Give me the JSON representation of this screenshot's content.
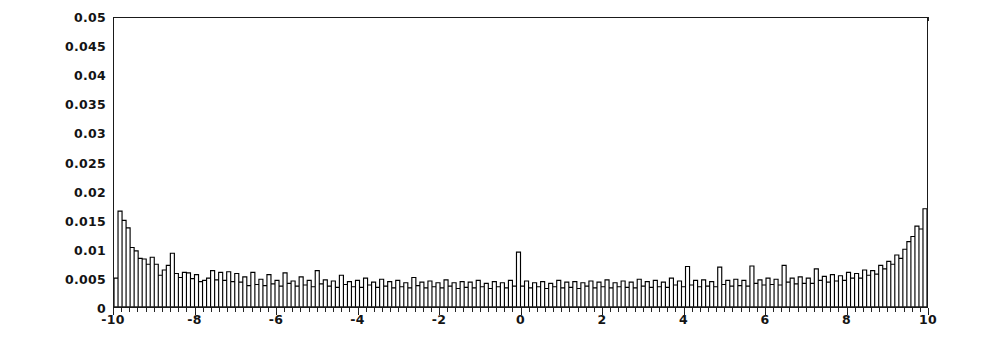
{
  "chart_data": {
    "type": "bar",
    "title": "",
    "subtitle": "",
    "xlabel": "",
    "ylabel": "",
    "xlim": [
      -10,
      10
    ],
    "ylim": [
      0,
      0.05
    ],
    "grid": false,
    "legend": null,
    "bar_color": "#ffffff",
    "bar_edge_color": "#000000",
    "axis_color": "#1a1a1a",
    "background_color": "#ffffff",
    "n_bins": 200,
    "bin_width": 0.1,
    "x_ticks": [
      -10,
      -8,
      -6,
      -4,
      -2,
      0,
      2,
      4,
      6,
      8,
      10
    ],
    "x_tick_labels": [
      "-10",
      "-8",
      "-6",
      "-4",
      "-2",
      "0",
      "2",
      "4",
      "6",
      "8",
      "10"
    ],
    "y_ticks": [
      0,
      0.005,
      0.01,
      0.015,
      0.02,
      0.025,
      0.03,
      0.035,
      0.04,
      0.045,
      0.05
    ],
    "y_tick_labels": [
      "0",
      "0.005",
      "0.01",
      "0.015",
      "0.02",
      "0.025",
      "0.03",
      "0.035",
      "0.04",
      "0.045",
      "0.05"
    ],
    "bin_centers": [
      -9.95,
      -9.85,
      -9.75,
      -9.65,
      -9.55,
      -9.45,
      -9.35,
      -9.25,
      -9.15,
      -9.05,
      -8.95,
      -8.85,
      -8.75,
      -8.65,
      -8.55,
      -8.45,
      -8.35,
      -8.25,
      -8.15,
      -8.05,
      -7.95,
      -7.85,
      -7.75,
      -7.65,
      -7.55,
      -7.45,
      -7.35,
      -7.25,
      -7.15,
      -7.05,
      -6.95,
      -6.85,
      -6.75,
      -6.65,
      -6.55,
      -6.45,
      -6.35,
      -6.25,
      -6.15,
      -6.05,
      -5.95,
      -5.85,
      -5.75,
      -5.65,
      -5.55,
      -5.45,
      -5.35,
      -5.25,
      -5.15,
      -5.05,
      -4.95,
      -4.85,
      -4.75,
      -4.65,
      -4.55,
      -4.45,
      -4.35,
      -4.25,
      -4.15,
      -4.05,
      -3.95,
      -3.85,
      -3.75,
      -3.65,
      -3.55,
      -3.45,
      -3.35,
      -3.25,
      -3.15,
      -3.05,
      -2.95,
      -2.85,
      -2.75,
      -2.65,
      -2.55,
      -2.45,
      -2.35,
      -2.25,
      -2.15,
      -2.05,
      -1.95,
      -1.85,
      -1.75,
      -1.65,
      -1.55,
      -1.45,
      -1.35,
      -1.25,
      -1.15,
      -1.05,
      -0.95,
      -0.85,
      -0.75,
      -0.65,
      -0.55,
      -0.45,
      -0.35,
      -0.25,
      -0.15,
      -0.05,
      0.05,
      0.15,
      0.25,
      0.35,
      0.45,
      0.55,
      0.65,
      0.75,
      0.85,
      0.95,
      1.05,
      1.15,
      1.25,
      1.35,
      1.45,
      1.55,
      1.65,
      1.75,
      1.85,
      1.95,
      2.05,
      2.15,
      2.25,
      2.35,
      2.45,
      2.55,
      2.65,
      2.75,
      2.85,
      2.95,
      3.05,
      3.15,
      3.25,
      3.35,
      3.45,
      3.55,
      3.65,
      3.75,
      3.85,
      3.95,
      4.05,
      4.15,
      4.25,
      4.35,
      4.45,
      4.55,
      4.65,
      4.75,
      4.85,
      4.95,
      5.05,
      5.15,
      5.25,
      5.35,
      5.45,
      5.55,
      5.65,
      5.75,
      5.85,
      5.95,
      6.05,
      6.15,
      6.25,
      6.35,
      6.45,
      6.55,
      6.65,
      6.75,
      6.85,
      6.95,
      7.05,
      7.15,
      7.25,
      7.35,
      7.45,
      7.55,
      7.65,
      7.75,
      7.85,
      7.95,
      8.05,
      8.15,
      8.25,
      8.35,
      8.45,
      8.55,
      8.65,
      8.75,
      8.85,
      8.95,
      9.05,
      9.15,
      9.25,
      9.35,
      9.45,
      9.55,
      9.65,
      9.75,
      9.85,
      9.95
    ],
    "values": [
      0.005,
      0.0166,
      0.015,
      0.0137,
      0.0103,
      0.0097,
      0.0084,
      0.0083,
      0.0074,
      0.0086,
      0.0074,
      0.0055,
      0.0064,
      0.0072,
      0.0093,
      0.0058,
      0.0051,
      0.006,
      0.0059,
      0.0049,
      0.0056,
      0.0044,
      0.0046,
      0.005,
      0.0063,
      0.0047,
      0.006,
      0.0046,
      0.0061,
      0.0044,
      0.0058,
      0.0043,
      0.0052,
      0.0037,
      0.006,
      0.0039,
      0.0048,
      0.0037,
      0.0056,
      0.004,
      0.0046,
      0.0036,
      0.0059,
      0.0041,
      0.0045,
      0.0036,
      0.0052,
      0.0038,
      0.0046,
      0.0035,
      0.0063,
      0.004,
      0.0047,
      0.0036,
      0.0045,
      0.0034,
      0.0055,
      0.0039,
      0.0044,
      0.0035,
      0.0046,
      0.0034,
      0.005,
      0.0038,
      0.0043,
      0.0034,
      0.0048,
      0.0036,
      0.0044,
      0.0033,
      0.0046,
      0.0035,
      0.0042,
      0.0033,
      0.0051,
      0.0037,
      0.0043,
      0.0033,
      0.0045,
      0.0035,
      0.0042,
      0.0033,
      0.0047,
      0.0036,
      0.0042,
      0.0032,
      0.0044,
      0.0034,
      0.0043,
      0.0033,
      0.0046,
      0.0035,
      0.0041,
      0.0032,
      0.0044,
      0.0035,
      0.0042,
      0.0033,
      0.0046,
      0.0036,
      0.0095,
      0.0036,
      0.0045,
      0.0033,
      0.0042,
      0.0035,
      0.0044,
      0.0032,
      0.0041,
      0.0035,
      0.0046,
      0.0033,
      0.0043,
      0.0034,
      0.0044,
      0.0032,
      0.0042,
      0.0036,
      0.0045,
      0.0033,
      0.0043,
      0.0035,
      0.0047,
      0.0033,
      0.0042,
      0.0035,
      0.0045,
      0.0034,
      0.0043,
      0.0033,
      0.0048,
      0.0036,
      0.0044,
      0.0034,
      0.0046,
      0.0035,
      0.0043,
      0.0034,
      0.005,
      0.0038,
      0.0045,
      0.0035,
      0.007,
      0.0038,
      0.0046,
      0.0035,
      0.0047,
      0.0036,
      0.0044,
      0.0035,
      0.0069,
      0.0039,
      0.0046,
      0.0036,
      0.0048,
      0.0037,
      0.0046,
      0.0036,
      0.0071,
      0.0041,
      0.0047,
      0.0038,
      0.005,
      0.0039,
      0.0048,
      0.0038,
      0.0072,
      0.0043,
      0.005,
      0.004,
      0.0052,
      0.0041,
      0.005,
      0.0041,
      0.0066,
      0.0046,
      0.0053,
      0.0043,
      0.0056,
      0.0045,
      0.0054,
      0.0046,
      0.006,
      0.005,
      0.0058,
      0.005,
      0.0064,
      0.0055,
      0.0063,
      0.0057,
      0.0072,
      0.0066,
      0.0079,
      0.0074,
      0.009,
      0.0084,
      0.01,
      0.0113,
      0.0122,
      0.014,
      0.0135,
      0.017
    ]
  }
}
